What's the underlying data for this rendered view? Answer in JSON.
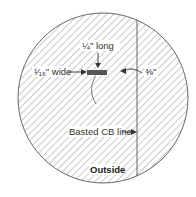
{
  "diagram": {
    "labels": {
      "long": "¼\" long",
      "wide": "¹⁄₁₆\" wide",
      "offset": "⅜\"",
      "basted_line": "Basted CB line",
      "outside": "Outside"
    },
    "colors": {
      "hatch": "#777777",
      "outline": "#555555",
      "text": "#333333",
      "mark": "#444444"
    }
  }
}
